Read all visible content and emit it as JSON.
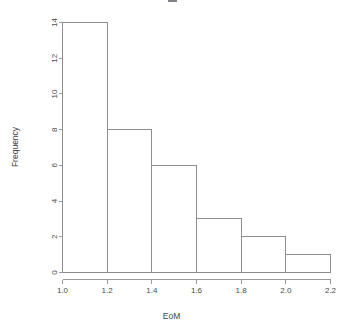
{
  "chart": {
    "xlabel": "EoM",
    "ylabel": "Frequency",
    "title": ""
  },
  "chart_data": {
    "type": "bar",
    "title": "",
    "subtitle": "",
    "xlabel": "EoM",
    "ylabel": "Frequency",
    "bin_edges": [
      1.0,
      1.2,
      1.4,
      1.6,
      1.8,
      2.0,
      2.2
    ],
    "categories": [
      "1.0-1.2",
      "1.2-1.4",
      "1.4-1.6",
      "1.6-1.8",
      "1.8-2.0",
      "2.0-2.2"
    ],
    "values": [
      14,
      8,
      6,
      3,
      2,
      1
    ],
    "xlim": [
      1.0,
      2.2
    ],
    "ylim": [
      0,
      14
    ],
    "xticks": [
      1.0,
      1.2,
      1.4,
      1.6,
      1.8,
      2.0,
      2.2
    ],
    "xticklabels": [
      "1.0",
      "1.2",
      "1.4",
      "1.6",
      "1.8",
      "2.0",
      "2.2"
    ],
    "yticks": [
      0,
      2,
      4,
      6,
      8,
      10,
      12,
      14
    ],
    "yticklabels": [
      "0",
      "2",
      "4",
      "6",
      "8",
      "10",
      "12",
      "14"
    ],
    "grid": false,
    "legend": false,
    "bar_fill": "#ffffff",
    "bar_stroke": "#8e8e8e",
    "axis_color": "#9a9a9a",
    "background": "#ffffff"
  }
}
